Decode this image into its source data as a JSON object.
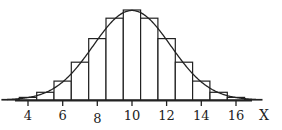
{
  "chart_data": {
    "type": "bar",
    "subtype": "histogram_with_normal_curve",
    "title": "",
    "xlabel": "X",
    "ylabel": "",
    "categories": [
      3,
      4,
      5,
      6,
      7,
      8,
      9,
      10,
      11,
      12,
      13,
      14,
      15,
      16,
      17
    ],
    "values": [
      0.001,
      0.005,
      0.015,
      0.037,
      0.074,
      0.12,
      0.16,
      0.176,
      0.16,
      0.12,
      0.074,
      0.037,
      0.015,
      0.005,
      0.001
    ],
    "x_ticks": [
      4,
      6,
      8,
      10,
      12,
      14,
      16
    ],
    "xlim": [
      3.3,
      17.2
    ],
    "ylim": [
      0,
      0.18
    ],
    "grid": false,
    "legend": null,
    "overlay_curve": {
      "type": "normal",
      "mean": 10,
      "sd": 2.236
    },
    "colors": {
      "bar_fill": "#ffffff",
      "bar_stroke": "#222222",
      "curve": "#222222",
      "axis": "#222222"
    }
  },
  "axis": {
    "x_title": "X",
    "tick_labels": [
      "4",
      "6",
      "8",
      "10",
      "12",
      "14",
      "16"
    ]
  }
}
